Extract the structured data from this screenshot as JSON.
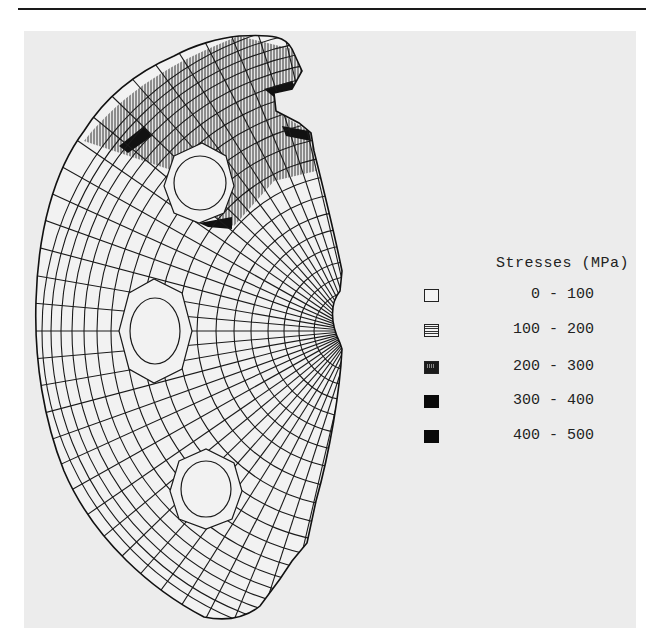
{
  "figure": {
    "legend": {
      "title": "Stresses (MPa)",
      "items": [
        {
          "range": "0 - 100",
          "fill": "empty"
        },
        {
          "range": "100 - 200",
          "fill": "horizontal-hatch"
        },
        {
          "range": "200 - 300",
          "fill": "dense-dark"
        },
        {
          "range": "300 - 400",
          "fill": "solid-black"
        },
        {
          "range": "400 - 500",
          "fill": "solid-black"
        }
      ]
    },
    "colors": {
      "panel": "#ececec",
      "mesh_line": "#1a1a1a",
      "high_stress": "#0a0a0a"
    }
  }
}
